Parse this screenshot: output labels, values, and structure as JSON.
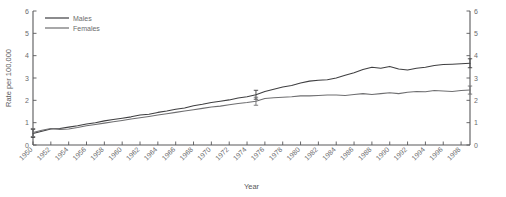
{
  "chart_data": {
    "type": "line",
    "title": "",
    "xlabel": "Year",
    "ylabel": "Rate per 100,000",
    "ylabel_right": "",
    "xlim": [
      1950,
      1999
    ],
    "ylim": [
      0,
      6
    ],
    "yticks": [
      0,
      1,
      2,
      3,
      4,
      5,
      6
    ],
    "ytick_labels": [
      "0",
      "1",
      "2",
      "3",
      "4",
      "5",
      "6"
    ],
    "yticks_right": [
      0,
      1,
      2,
      3,
      4,
      5,
      6
    ],
    "ytick_labels_right": [
      "0",
      "1",
      "2",
      "3",
      "4",
      "5",
      "6"
    ],
    "xticks": [
      1950,
      1952,
      1954,
      1956,
      1958,
      1960,
      1962,
      1964,
      1966,
      1968,
      1970,
      1972,
      1974,
      1976,
      1978,
      1980,
      1982,
      1984,
      1986,
      1988,
      1990,
      1992,
      1994,
      1996,
      1998
    ],
    "xtick_labels": [
      "1950",
      "1952",
      "1954",
      "1956",
      "1958",
      "1960",
      "1962",
      "1964",
      "1966",
      "1968",
      "1970",
      "1972",
      "1974",
      "1976",
      "1978",
      "1980",
      "1982",
      "1984",
      "1986",
      "1988",
      "1990",
      "1992",
      "1994",
      "1996",
      "1998"
    ],
    "grid": false,
    "legend_position": "top-left",
    "colors": {
      "males": "#3f3f41",
      "females": "#6e6e70",
      "axis": "#58585a"
    },
    "x": [
      1950,
      1951,
      1952,
      1953,
      1954,
      1955,
      1956,
      1957,
      1958,
      1959,
      1960,
      1961,
      1962,
      1963,
      1964,
      1965,
      1966,
      1967,
      1968,
      1969,
      1970,
      1971,
      1972,
      1973,
      1974,
      1975,
      1976,
      1977,
      1978,
      1979,
      1980,
      1981,
      1982,
      1983,
      1984,
      1985,
      1986,
      1987,
      1988,
      1989,
      1990,
      1991,
      1992,
      1993,
      1994,
      1995,
      1996,
      1997,
      1998,
      1999
    ],
    "series": [
      {
        "name": "Males",
        "values": [
          0.52,
          0.62,
          0.72,
          0.74,
          0.8,
          0.86,
          0.94,
          1.0,
          1.08,
          1.14,
          1.2,
          1.26,
          1.34,
          1.38,
          1.46,
          1.52,
          1.6,
          1.66,
          1.76,
          1.82,
          1.9,
          1.96,
          2.02,
          2.1,
          2.16,
          2.25,
          2.4,
          2.5,
          2.6,
          2.66,
          2.78,
          2.86,
          2.9,
          2.92,
          3.0,
          3.12,
          3.24,
          3.38,
          3.48,
          3.44,
          3.52,
          3.4,
          3.36,
          3.44,
          3.48,
          3.56,
          3.6,
          3.62,
          3.64,
          3.66
        ],
        "errorbars": [
          {
            "x": 1950,
            "y": 0.52,
            "lower": 0.34,
            "upper": 0.7
          },
          {
            "x": 1975,
            "y": 2.25,
            "lower": 2.05,
            "upper": 2.45
          },
          {
            "x": 1999,
            "y": 3.66,
            "lower": 3.46,
            "upper": 3.86
          }
        ]
      },
      {
        "name": "Females",
        "values": [
          0.56,
          0.66,
          0.74,
          0.7,
          0.72,
          0.78,
          0.86,
          0.92,
          0.98,
          1.04,
          1.1,
          1.16,
          1.22,
          1.28,
          1.34,
          1.4,
          1.46,
          1.52,
          1.58,
          1.64,
          1.7,
          1.74,
          1.8,
          1.86,
          1.9,
          1.96,
          2.08,
          2.12,
          2.14,
          2.16,
          2.2,
          2.2,
          2.22,
          2.24,
          2.24,
          2.22,
          2.26,
          2.3,
          2.26,
          2.3,
          2.34,
          2.3,
          2.36,
          2.4,
          2.38,
          2.44,
          2.42,
          2.4,
          2.44,
          2.46
        ],
        "errorbars": [
          {
            "x": 1950,
            "y": 0.56,
            "lower": 0.38,
            "upper": 0.74
          },
          {
            "x": 1975,
            "y": 1.96,
            "lower": 1.78,
            "upper": 2.14
          },
          {
            "x": 1999,
            "y": 2.46,
            "lower": 2.28,
            "upper": 2.64
          }
        ]
      }
    ]
  },
  "legend": {
    "items": [
      {
        "label": "Males"
      },
      {
        "label": "Females"
      }
    ]
  }
}
